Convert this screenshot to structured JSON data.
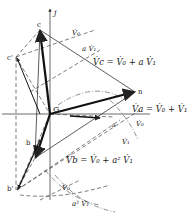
{
  "diagram": {
    "type": "phasor-diagram",
    "axis_label_j": "j",
    "origin_label": "G",
    "points": {
      "c": "c",
      "c_prime": "c'",
      "n": "n",
      "b": "b",
      "b_prime": "b'",
      "a": "a"
    },
    "labels": {
      "v0_top": "V̇₀",
      "av1_top": "a V̇₁",
      "vc_eq": "V̇c = V̇₀ + a V̇₁",
      "va_eq": "V̇a = V̇₀ + V̇₁",
      "v0_right": "V̇₀",
      "v1_right": "V̇₁",
      "vb_eq": "V̇b = V̇₀ + a² V̇₁",
      "v0_bottom": "V̇₀",
      "a2v1_bottom": "a² V̇₁"
    },
    "colors": {
      "line": "#333333",
      "text": "#222222"
    }
  }
}
